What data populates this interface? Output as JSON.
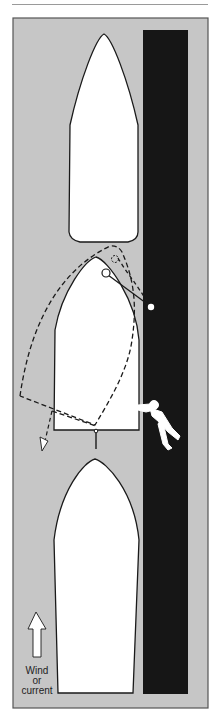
{
  "figure": {
    "colors": {
      "water": "#c6c6c6",
      "dock": "#161616",
      "boat_fill": "#ffffff",
      "outline": "#1a1a1a",
      "frame_border": "#555555"
    },
    "elements": {
      "boat_ahead": "moored-boat-ahead",
      "boat_center": "departing-boat",
      "boat_astern": "moored-boat-astern",
      "dock": "dock",
      "spring_line": "bow-spring-line",
      "dashed_path": "pivoted-boat-outline",
      "person": "person-pushing-stern",
      "direction_arrow": "stern-swing-arrow"
    },
    "legend": {
      "arrow_icon": "up-arrow-icon",
      "label_line1": "Wind",
      "label_line2": "or",
      "label_line3": "current"
    }
  }
}
